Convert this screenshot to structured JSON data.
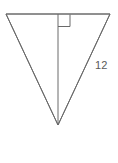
{
  "figure": {
    "type": "geometry-diagram",
    "shape": "inverted-triangle-with-altitude",
    "background_color": "#ffffff",
    "stroke_color": "#6a6a6a",
    "label_color": "#5a5a5a",
    "stroke_width": 1,
    "canvas": {
      "width": 118,
      "height": 163
    },
    "vertices": {
      "top_left": {
        "x": 6,
        "y": 14
      },
      "top_right": {
        "x": 110,
        "y": 14
      },
      "apex_bottom": {
        "x": 58,
        "y": 125
      }
    },
    "altitude": {
      "from": {
        "x": 58,
        "y": 14
      },
      "to": {
        "x": 58,
        "y": 125
      }
    },
    "right_angle_marker": {
      "x": 58,
      "y": 15,
      "size": 12,
      "position": "right-of-altitude-at-top-edge"
    },
    "labels": [
      {
        "name": "side-length-label",
        "text": "12",
        "x": 95,
        "y": 69,
        "attached_to": "right-side"
      }
    ]
  }
}
